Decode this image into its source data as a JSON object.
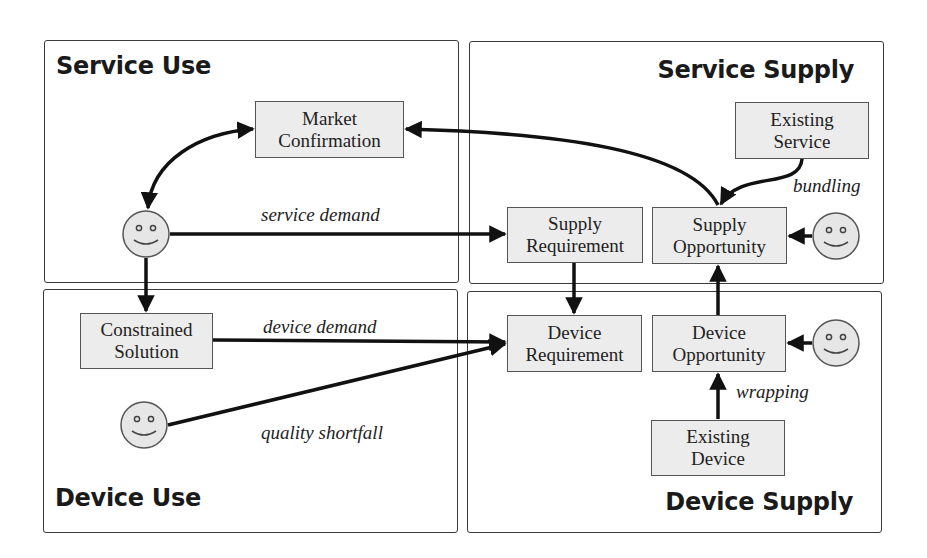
{
  "colors": {
    "node_fill": "#ececec",
    "node_border": "#555555",
    "panel_border": "#3a3a3a",
    "arrow": "#111111",
    "actor_fill": "#e6e6e6"
  },
  "panels": {
    "service_use": {
      "title": "Service Use"
    },
    "service_supply": {
      "title": "Service Supply"
    },
    "device_use": {
      "title": "Device Use"
    },
    "device_supply": {
      "title": "Device Supply"
    }
  },
  "nodes": {
    "market_confirmation": {
      "line1": "Market",
      "line2": "Confirmation"
    },
    "existing_service": {
      "line1": "Existing",
      "line2": "Service"
    },
    "supply_requirement": {
      "line1": "Supply",
      "line2": "Requirement"
    },
    "supply_opportunity": {
      "line1": "Supply",
      "line2": "Opportunity"
    },
    "constrained_solution": {
      "line1": "Constrained",
      "line2": "Solution"
    },
    "device_requirement": {
      "line1": "Device",
      "line2": "Requirement"
    },
    "device_opportunity": {
      "line1": "Device",
      "line2": "Opportunity"
    },
    "existing_device": {
      "line1": "Existing",
      "line2": "Device"
    }
  },
  "edge_labels": {
    "service_demand": "service demand",
    "bundling": "bundling",
    "device_demand": "device demand",
    "quality_shortfall": "quality shortfall",
    "wrapping": "wrapping"
  },
  "actors": [
    {
      "id": "service-user",
      "icon": "smiley-icon"
    },
    {
      "id": "service-supplier",
      "icon": "smiley-icon"
    },
    {
      "id": "device-user",
      "icon": "smiley-icon"
    },
    {
      "id": "device-supplier",
      "icon": "smiley-icon"
    }
  ],
  "edges": [
    {
      "from": "service-user",
      "to": "market_confirmation",
      "type": "bidirectional"
    },
    {
      "from": "supply_opportunity",
      "to": "market_confirmation"
    },
    {
      "from": "existing_service",
      "to": "supply_opportunity",
      "label": "bundling"
    },
    {
      "from": "service-user",
      "to": "supply_requirement",
      "label": "service demand"
    },
    {
      "from": "service-supplier",
      "to": "supply_opportunity"
    },
    {
      "from": "service-user",
      "to": "constrained_solution"
    },
    {
      "from": "supply_requirement",
      "to": "device_requirement"
    },
    {
      "from": "device_opportunity",
      "to": "supply_opportunity"
    },
    {
      "from": "constrained_solution",
      "to": "device_requirement",
      "label": "device demand"
    },
    {
      "from": "device-user",
      "to": "device_requirement",
      "label": "quality shortfall"
    },
    {
      "from": "device-supplier",
      "to": "device_opportunity"
    },
    {
      "from": "existing_device",
      "to": "device_opportunity",
      "label": "wrapping"
    }
  ]
}
